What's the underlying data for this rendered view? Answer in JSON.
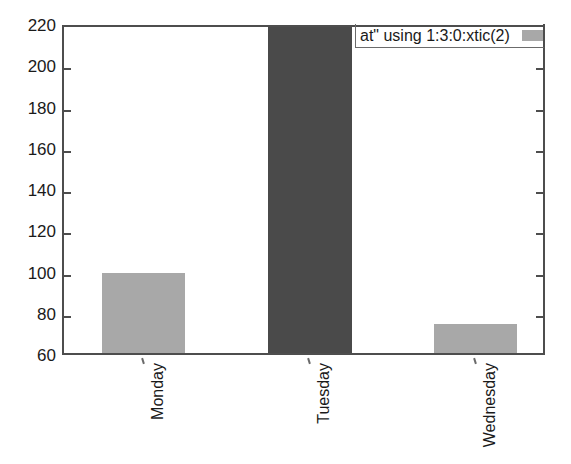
{
  "chart_data": {
    "type": "bar",
    "title": "",
    "subtitle": "",
    "xlabel": "",
    "ylabel": "",
    "categories": [
      "Monday",
      "Tuesday",
      "Wednesday"
    ],
    "values": [
      100,
      220,
      75
    ],
    "series": [
      {
        "name": "at\" using 1:3:0:xtic(2)",
        "values": [
          100,
          220,
          75
        ]
      }
    ],
    "bar_colors": [
      "#a8a8a8",
      "#4a4a4a",
      "#a8a8a8"
    ],
    "ylim": [
      60,
      220
    ],
    "yticks": [
      60,
      80,
      100,
      120,
      140,
      160,
      180,
      200,
      220
    ],
    "ytick_labels": [
      "60",
      "80",
      "100",
      "120",
      "140",
      "160",
      "180",
      "200",
      "220"
    ],
    "grid": false,
    "legend_position": "top-right"
  },
  "legend": {
    "entries": [
      {
        "label": "at\" using 1:3:0:xtic(2)",
        "swatch_color": "#a8a8a8"
      }
    ]
  },
  "axes": {
    "frame_color": "#4d4d4d",
    "tick_color": "#6b6b6b",
    "text_color": "#1a1a1a"
  },
  "colors": {
    "background": "#ffffff",
    "bar_light": "#a8a8a8",
    "bar_dark": "#4a4a4a"
  }
}
